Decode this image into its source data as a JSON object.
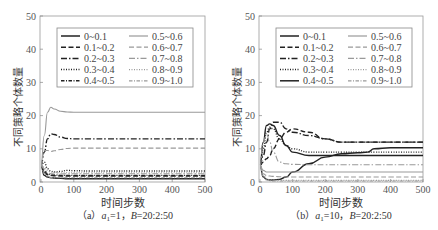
{
  "chart_data": [
    {
      "type": "line",
      "panel": "a",
      "caption": "(a) a₁=1, B=20:2:50",
      "caption_parts": {
        "prefix": "（a）",
        "param1": "a",
        "sub": "1",
        "eq1": "=1，",
        "param2": "B",
        "eq2": "=20:2:50"
      },
      "xlabel": "时间步数",
      "ylabel": "不同策略个体数量",
      "xlim": [
        0,
        500
      ],
      "ylim": [
        0,
        50
      ],
      "xticks": [
        0,
        100,
        200,
        300,
        400,
        500
      ],
      "yticks": [
        0,
        10,
        20,
        30,
        40,
        50
      ],
      "grid": false,
      "legend_position": "upper center, 2 columns",
      "x": [
        0,
        10,
        20,
        30,
        40,
        60,
        80,
        100,
        150,
        200,
        300,
        400,
        500
      ],
      "series": [
        {
          "name": "0~0.1",
          "style": "solid",
          "color": "#222222",
          "values": [
            5,
            2,
            1.5,
            1.3,
            1.2,
            1.1,
            1.0,
            1.0,
            1.0,
            1.0,
            1.0,
            1.0,
            1.0
          ]
        },
        {
          "name": "0.1~0.2",
          "style": "dash",
          "color": "#222222",
          "values": [
            5,
            3,
            2.2,
            2.0,
            1.9,
            1.8,
            1.8,
            1.8,
            1.8,
            1.8,
            1.8,
            1.8,
            1.8
          ]
        },
        {
          "name": "0.2~0.3",
          "style": "dashdot",
          "color": "#222222",
          "values": [
            5,
            9,
            13,
            14.5,
            14.3,
            13.5,
            13.1,
            13.0,
            13.0,
            13.0,
            13.0,
            13.0,
            13.0
          ]
        },
        {
          "name": "0.3~0.4",
          "style": "dot",
          "color": "#222222",
          "values": [
            5,
            6,
            4,
            3.2,
            3.0,
            3.2,
            3.5,
            3.4,
            3.3,
            3.3,
            3.3,
            3.3,
            3.3
          ]
        },
        {
          "name": "0.4~0.5",
          "style": "dashdot2",
          "color": "#222222",
          "values": [
            5,
            3.5,
            2.5,
            2.2,
            2.1,
            2.0,
            2.0,
            2.0,
            2.0,
            2.0,
            2.0,
            2.0,
            2.0
          ]
        },
        {
          "name": "0.5~0.6",
          "style": "solid",
          "color": "#999999",
          "values": [
            5,
            14,
            21,
            22.5,
            22,
            21.3,
            21.1,
            21.0,
            21.0,
            21.0,
            21.0,
            21.0,
            21.0
          ]
        },
        {
          "name": "0.6~0.7",
          "style": "dash",
          "color": "#999999",
          "values": [
            5,
            9.5,
            9.5,
            9.2,
            9.4,
            9.8,
            10.1,
            10.2,
            10.2,
            10.2,
            10.2,
            10.2,
            10.2
          ]
        },
        {
          "name": "0.7~0.8",
          "style": "dashdot",
          "color": "#999999",
          "values": [
            5,
            4,
            2.8,
            2.5,
            2.4,
            2.4,
            2.5,
            2.5,
            2.5,
            2.5,
            2.5,
            2.5,
            2.5
          ]
        },
        {
          "name": "0.8~0.9",
          "style": "dot",
          "color": "#999999",
          "values": [
            5,
            4.5,
            3.5,
            3.0,
            2.9,
            2.8,
            2.8,
            2.8,
            2.8,
            2.8,
            2.8,
            2.8,
            2.8
          ]
        },
        {
          "name": "0.9~1.0",
          "style": "dashdot2",
          "color": "#999999",
          "values": [
            5,
            2.5,
            1.6,
            1.4,
            1.3,
            1.3,
            1.3,
            1.3,
            1.3,
            1.3,
            1.3,
            1.3,
            1.3
          ]
        }
      ]
    },
    {
      "type": "line",
      "panel": "b",
      "caption": "(b) a₁=10, B=20:2:50",
      "caption_parts": {
        "prefix": "（b）",
        "param1": "a",
        "sub": "1",
        "eq1": "=10，",
        "param2": "B",
        "eq2": "=20:2:50"
      },
      "xlabel": "时间步数",
      "ylabel": "不同策略个体数量",
      "xlim": [
        0,
        500
      ],
      "ylim": [
        0,
        50
      ],
      "xticks": [
        0,
        100,
        200,
        300,
        400,
        500
      ],
      "yticks": [
        0,
        10,
        20,
        30,
        40,
        50
      ],
      "grid": false,
      "legend_position": "upper center, 2 columns",
      "x": [
        0,
        10,
        20,
        30,
        40,
        60,
        80,
        100,
        150,
        200,
        250,
        300,
        330,
        350,
        400,
        500
      ],
      "series": [
        {
          "name": "0~0.1",
          "style": "solid",
          "color": "#222222",
          "values": [
            5,
            12,
            17,
            17.5,
            17,
            14,
            11,
            9,
            8,
            8,
            8,
            8,
            8,
            8,
            8,
            8
          ]
        },
        {
          "name": "0.1~0.2",
          "style": "dash",
          "color": "#222222",
          "values": [
            5,
            6,
            7,
            8,
            10,
            13,
            15,
            16,
            15,
            13,
            12,
            12,
            12,
            12,
            12,
            12
          ]
        },
        {
          "name": "0.2~0.3",
          "style": "dashdot",
          "color": "#222222",
          "values": [
            5,
            8,
            12,
            16,
            18,
            18,
            16,
            15,
            14,
            13,
            12,
            12,
            12,
            12,
            12,
            12
          ]
        },
        {
          "name": "0.3~0.4",
          "style": "dot",
          "color": "#222222",
          "values": [
            5,
            10,
            15,
            16.5,
            16,
            13,
            11,
            10,
            9,
            9,
            9,
            9,
            9,
            9,
            9,
            9
          ]
        },
        {
          "name": "0.4~0.5",
          "style": "solid",
          "color": "#222222",
          "values": [
            5,
            1.5,
            0.8,
            0.6,
            0.6,
            0.8,
            1.5,
            3,
            5.5,
            7.5,
            8.5,
            8.8,
            9,
            10,
            10.3,
            10.3
          ]
        },
        {
          "name": "0.5~0.6",
          "style": "solid",
          "color": "#999999",
          "values": [
            5,
            3.5,
            3,
            3,
            3,
            3,
            3,
            3,
            3,
            3,
            3,
            3,
            3,
            3,
            3,
            3
          ]
        },
        {
          "name": "0.6~0.7",
          "style": "dash",
          "color": "#999999",
          "values": [
            5,
            2.5,
            2,
            1.8,
            1.7,
            1.6,
            1.5,
            1.5,
            1.5,
            1.5,
            1.5,
            1.5,
            1.5,
            1.5,
            1.5,
            1.5
          ]
        },
        {
          "name": "0.7~0.8",
          "style": "dashdot",
          "color": "#999999",
          "values": [
            5,
            12,
            14.5,
            12,
            9,
            6,
            5.5,
            5.3,
            5.2,
            5.2,
            5.2,
            5.2,
            5.2,
            5.2,
            5.2,
            5.2
          ]
        },
        {
          "name": "0.8~0.9",
          "style": "dot",
          "color": "#999999",
          "values": [
            5,
            2,
            1,
            0.7,
            0.6,
            0.5,
            0.5,
            0.5,
            0.5,
            0.5,
            0.5,
            0.5,
            0.5,
            0.5,
            0.5,
            0.5
          ]
        },
        {
          "name": "0.9~1.0",
          "style": "dashdot2",
          "color": "#999999",
          "values": [
            5,
            1.5,
            0.6,
            0.4,
            0.3,
            0.3,
            0.3,
            0.3,
            0.3,
            0.3,
            0.3,
            0.3,
            0.3,
            0.3,
            0.3,
            0.3
          ]
        }
      ]
    }
  ],
  "panels": [
    {
      "caption": "(a) a₁=1, B=20:2:50"
    },
    {
      "caption": "(b) a₁=10, B=20:2:50"
    }
  ]
}
